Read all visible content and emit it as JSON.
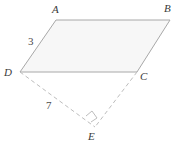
{
  "figure": {
    "type": "geometry-diagram",
    "colors": {
      "stroke": "#a8a8a8",
      "dashed_stroke": "#bdbdbd",
      "fill": "#f7f7f7",
      "label": "#3a3a3a",
      "background": "#ffffff"
    },
    "vertices": [
      {
        "name": "A",
        "label": "A",
        "x": 56,
        "y": 20,
        "label_x": 52,
        "label_y": 4
      },
      {
        "name": "B",
        "label": "B",
        "x": 170,
        "y": 20,
        "label_x": 164,
        "label_y": 3
      },
      {
        "name": "C",
        "label": "C",
        "x": 137,
        "y": 72,
        "label_x": 140,
        "label_y": 71
      },
      {
        "name": "D",
        "label": "D",
        "x": 20,
        "y": 72,
        "label_x": 4,
        "label_y": 67
      },
      {
        "name": "E",
        "label": "E",
        "x": 95,
        "y": 127,
        "label_x": 88,
        "label_y": 131
      }
    ],
    "solid_edges": [
      {
        "name": "edge-AB",
        "from": "A",
        "to": "B"
      },
      {
        "name": "edge-BC",
        "from": "B",
        "to": "C"
      },
      {
        "name": "edge-CD",
        "from": "C",
        "to": "D"
      },
      {
        "name": "edge-DA",
        "from": "D",
        "to": "A"
      }
    ],
    "dashed_edges": [
      {
        "name": "edge-DE",
        "from": "D",
        "to": "E"
      },
      {
        "name": "edge-CE",
        "from": "C",
        "to": "E"
      }
    ],
    "length_labels": [
      {
        "name": "length-DA",
        "text": "3",
        "x": 28,
        "y": 36
      },
      {
        "name": "length-DE",
        "text": "7",
        "x": 46,
        "y": 100
      }
    ],
    "right_angle": {
      "name": "right-angle-mark-E",
      "at": "E",
      "points": "86,116 92,111 97,118 91,122"
    }
  }
}
